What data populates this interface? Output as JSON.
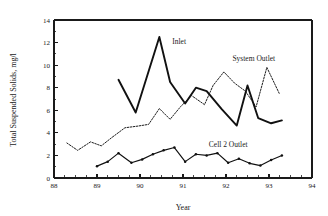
{
  "chart_data": {
    "type": "line",
    "title": "",
    "xlabel": "Year",
    "ylabel": "Total Suspended Solids, mg/l",
    "xlim": [
      88,
      94
    ],
    "ylim": [
      0,
      14
    ],
    "xticks": [
      88,
      89,
      90,
      91,
      92,
      93,
      94
    ],
    "yticks": [
      0,
      2,
      4,
      6,
      8,
      10,
      12,
      14
    ],
    "xtick_labels": [
      "88",
      "89",
      "90",
      "91",
      "92",
      "93",
      "94"
    ],
    "ytick_labels": [
      "0",
      "2",
      "4",
      "6",
      "8",
      "10",
      "12",
      "14"
    ],
    "x_minor_interval": 0.25,
    "grid": false,
    "legend_position": "inline-annotations",
    "series": [
      {
        "name": "Inlet",
        "style": "solid-thick",
        "annotation": "Inlet",
        "annotation_x": 90.75,
        "annotation_y": 11.9,
        "x": [
          89.5,
          89.9,
          90.45,
          90.7,
          91.05,
          91.3,
          91.55,
          91.9,
          92.25,
          92.5,
          92.75,
          93.05,
          93.3
        ],
        "y": [
          8.7,
          5.8,
          12.5,
          8.5,
          6.6,
          8.0,
          7.7,
          6.1,
          4.65,
          8.2,
          5.3,
          4.85,
          5.1
        ]
      },
      {
        "name": "System Outlet",
        "style": "dotted",
        "annotation": "System Outlet",
        "annotation_x": 92.15,
        "annotation_y": 10.4,
        "x": [
          88.3,
          88.55,
          88.85,
          89.1,
          89.35,
          89.65,
          89.95,
          90.2,
          90.45,
          90.7,
          90.95,
          91.2,
          91.5,
          91.7,
          91.95,
          92.2,
          92.45,
          92.7,
          92.95,
          93.25
        ],
        "y": [
          3.1,
          2.45,
          3.2,
          2.85,
          3.6,
          4.45,
          4.6,
          4.75,
          6.15,
          5.2,
          6.35,
          7.3,
          6.5,
          8.2,
          9.4,
          8.4,
          7.7,
          6.3,
          9.8,
          7.4
        ]
      },
      {
        "name": "Cell 2 Outlet",
        "style": "marked",
        "annotation": "Cell 2 Outlet",
        "annotation_x": 91.6,
        "annotation_y": 2.75,
        "x": [
          89.0,
          89.25,
          89.5,
          89.8,
          90.05,
          90.3,
          90.55,
          90.8,
          91.05,
          91.3,
          91.55,
          91.8,
          92.05,
          92.3,
          92.55,
          92.8,
          93.05,
          93.3
        ],
        "y": [
          1.05,
          1.45,
          2.2,
          1.35,
          1.65,
          2.1,
          2.45,
          2.7,
          1.45,
          2.1,
          2.0,
          2.2,
          1.35,
          1.7,
          1.3,
          1.1,
          1.6,
          2.0
        ]
      }
    ]
  }
}
